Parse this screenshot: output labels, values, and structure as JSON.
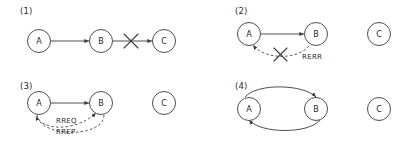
{
  "figure": {
    "background": "#ffffff",
    "stroke_color": "#3a3a3a",
    "dash_color": "#4a4a4a",
    "text_color": "#2b2b2b"
  },
  "panels": [
    {
      "number": "(1)",
      "nodes": [
        {
          "id": "a",
          "label": "A"
        },
        {
          "id": "b",
          "label": "B"
        },
        {
          "id": "c",
          "label": "C"
        }
      ],
      "edges": [
        {
          "from": "A",
          "to": "B",
          "style": "solid",
          "label": ""
        },
        {
          "from": "B",
          "to": "C",
          "style": "solid",
          "label": ""
        }
      ],
      "broken_link": "B-C"
    },
    {
      "number": "(2)",
      "nodes": [
        {
          "id": "a",
          "label": "A"
        },
        {
          "id": "b",
          "label": "B"
        },
        {
          "id": "c",
          "label": "C"
        }
      ],
      "edges": [
        {
          "from": "A",
          "to": "B",
          "style": "solid",
          "label": ""
        },
        {
          "from": "B",
          "to": "A",
          "style": "dashed",
          "label": "RERR"
        }
      ],
      "broken_link": "B-A"
    },
    {
      "number": "(3)",
      "nodes": [
        {
          "id": "a",
          "label": "A"
        },
        {
          "id": "b",
          "label": "B"
        },
        {
          "id": "c",
          "label": "C"
        }
      ],
      "edges": [
        {
          "from": "A",
          "to": "B",
          "style": "solid",
          "label": ""
        },
        {
          "from": "A",
          "to": "B",
          "style": "dashed",
          "label": "RREQ"
        },
        {
          "from": "B",
          "to": "A",
          "style": "dashed",
          "label": "RREP"
        }
      ],
      "broken_link": ""
    },
    {
      "number": "(4)",
      "nodes": [
        {
          "id": "a",
          "label": "A"
        },
        {
          "id": "b",
          "label": "B"
        },
        {
          "id": "c",
          "label": "C"
        }
      ],
      "edges": [
        {
          "from": "A",
          "to": "B",
          "style": "solid",
          "label": ""
        },
        {
          "from": "B",
          "to": "A",
          "style": "solid",
          "label": ""
        }
      ],
      "broken_link": ""
    }
  ]
}
